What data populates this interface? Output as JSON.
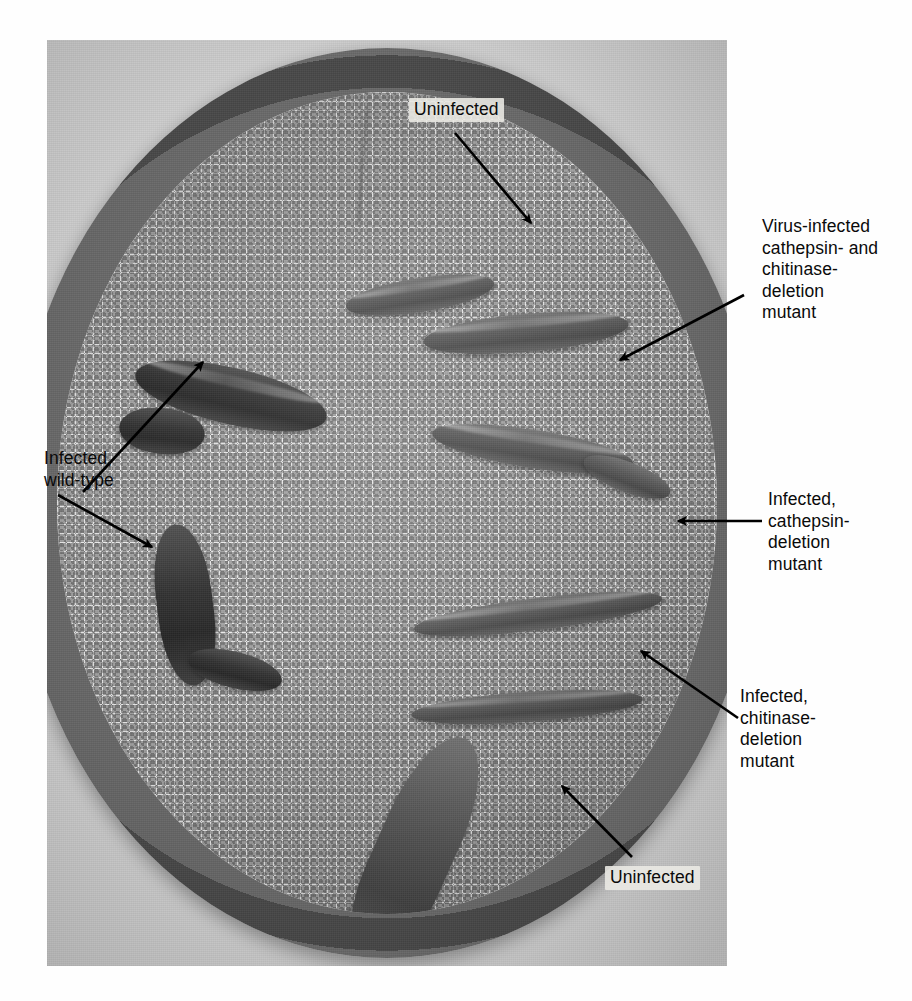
{
  "figure": {
    "type": "photograph",
    "labels": [
      {
        "id": "uninfected-top",
        "text": "Uninfected",
        "position": "top-centre",
        "on_photo": true,
        "arrow": {
          "from": [
            455,
            133
          ],
          "to": [
            531,
            223
          ],
          "style": "diagonal-down-right"
        }
      },
      {
        "id": "virus-infected-double-mutant",
        "text": "Virus-infected\ncathepsin- and\nchitinase-\ndeletion\nmutant",
        "position": "right-upper",
        "on_photo": false,
        "arrow": {
          "from": [
            744,
            295
          ],
          "to": [
            618,
            361
          ],
          "style": "diagonal-down-left"
        }
      },
      {
        "id": "infected-wild-type",
        "text": "Infected,\nwild-type",
        "position": "left",
        "on_photo": false,
        "arrow": {
          "from": [
            83,
            492
          ],
          "to": [
            202,
            361
          ],
          "style": "diagonal-up-right"
        },
        "arrow2": {
          "from": [
            60,
            497
          ],
          "to": [
            152,
            546
          ],
          "style": "diagonal-down-right"
        }
      },
      {
        "id": "infected-cathepsin-deletion-mutant",
        "text": "Infected,\ncathepsin-\ndeletion\nmutant",
        "position": "right-middle",
        "on_photo": false,
        "arrow": {
          "from": [
            762,
            521
          ],
          "to": [
            676,
            521
          ],
          "style": "horizontal-left"
        }
      },
      {
        "id": "infected-chitinase-deletion-mutant",
        "text": "Infected,\nchitinase-\ndeletion\nmutant",
        "position": "right-lower",
        "on_photo": false,
        "arrow": {
          "from": [
            738,
            718
          ],
          "to": [
            639,
            649
          ],
          "style": "diagonal-up-left"
        }
      },
      {
        "id": "uninfected-bottom",
        "text": "Uninfected",
        "position": "bottom-centre",
        "on_photo": true,
        "arrow": {
          "from": [
            632,
            857
          ],
          "to": [
            560,
            784
          ],
          "style": "diagonal-up-left"
        }
      }
    ],
    "larvae": [
      {
        "id": "larva-uninfected-top",
        "note": "large healthy larva, upper right of dish"
      },
      {
        "id": "larva-top-small",
        "note": "small larva at top of dish"
      },
      {
        "id": "larva-wild-type-infected",
        "note": "very dark shrunken larva, upper left"
      },
      {
        "id": "larva-double-mutant",
        "note": "larva at mid right, double-deletion mutant"
      },
      {
        "id": "larva-wild-type-second",
        "note": "dark curled larva, left of centre"
      },
      {
        "id": "larva-cathepsin-mutant",
        "note": "elongated larva, right of centre"
      },
      {
        "id": "larva-chitinase-mutant",
        "note": "larva at lower right"
      },
      {
        "id": "larva-uninfected-bottom",
        "note": "large healthy larva, lower centre"
      }
    ],
    "colors": {
      "medium": "#e9e7e2",
      "dish_rim": "#4c4a47",
      "larva_dark": "#19150f",
      "larva_mid": "#4c453d",
      "label_text": "#0a0a0a",
      "arrow": "#000000",
      "page_background": "#ffffff"
    }
  }
}
